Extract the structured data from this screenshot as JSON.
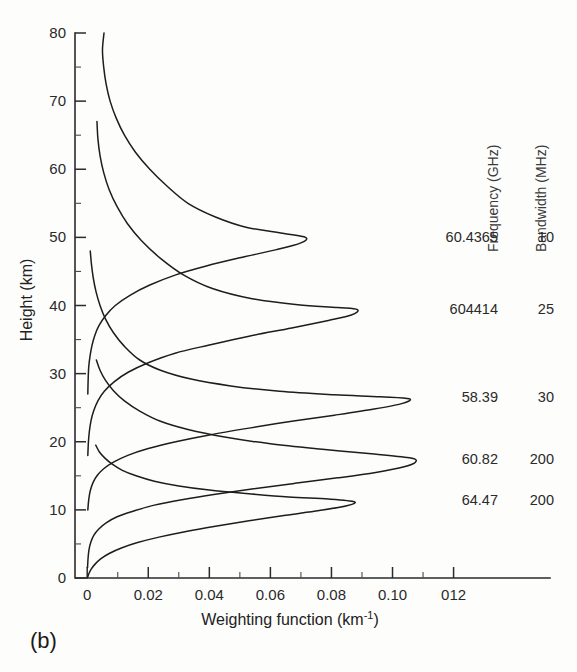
{
  "panel": {
    "label": "(b)"
  },
  "chart_data": {
    "type": "line",
    "title": "",
    "subtitle": "",
    "xlabel": "Weighting function (km",
    "xlabel_sup": "-1",
    "xlabel_close": ")",
    "xlabel_full": "Weighting function (km⁻¹)",
    "ylabel": "Height (km)",
    "xlim": [
      -0.004,
      0.128
    ],
    "ylim": [
      0,
      80
    ],
    "grid": false,
    "legend_position": "right",
    "x_ticks": [
      0,
      0.02,
      0.04,
      0.06,
      0.08,
      0.1,
      0.12
    ],
    "x_tick_labels": [
      "0",
      "0.02",
      "0.04",
      "0.06",
      "0.08",
      "0.10",
      "012"
    ],
    "x_minor_ticks": [
      0.01,
      0.03,
      0.05,
      0.07,
      0.09,
      0.11
    ],
    "y_ticks": [
      0,
      10,
      20,
      30,
      40,
      50,
      60,
      70,
      80
    ],
    "y_tick_labels": [
      "0",
      "10",
      "20",
      "30",
      "40",
      "50",
      "60",
      "70",
      "80"
    ],
    "y_minor_ticks": [
      5,
      15,
      25,
      35,
      45,
      55,
      65,
      75
    ],
    "legend_headers": [
      "Frequency (GHz)",
      "Bandwidth (MHz)"
    ],
    "series": [
      {
        "name": "60.4365",
        "frequency_ghz": "60.4365",
        "bandwidth_mhz": "10",
        "peak_x": 0.0715,
        "peak_y": 50,
        "label_y": 50,
        "points": [
          [
            0.0055,
            80
          ],
          [
            0.005,
            77.5
          ],
          [
            0.0054,
            75
          ],
          [
            0.0062,
            72.5
          ],
          [
            0.0075,
            70
          ],
          [
            0.0095,
            67.5
          ],
          [
            0.0122,
            65
          ],
          [
            0.0158,
            62.5
          ],
          [
            0.0205,
            60
          ],
          [
            0.0262,
            57.5
          ],
          [
            0.033,
            55
          ],
          [
            0.042,
            53
          ],
          [
            0.052,
            51.5
          ],
          [
            0.064,
            50.6
          ],
          [
            0.0715,
            50.0
          ],
          [
            0.07,
            49.2
          ],
          [
            0.062,
            48.2
          ],
          [
            0.05,
            47.0
          ],
          [
            0.039,
            45.8
          ],
          [
            0.029,
            44.5
          ],
          [
            0.0205,
            43.0
          ],
          [
            0.014,
            41.5
          ],
          [
            0.0092,
            40.0
          ],
          [
            0.006,
            38.5
          ],
          [
            0.0038,
            37.0
          ],
          [
            0.0024,
            35.5
          ],
          [
            0.0015,
            34.0
          ],
          [
            0.0009,
            32.5
          ],
          [
            0.0005,
            31.0
          ],
          [
            0.0003,
            29.0
          ],
          [
            0.0002,
            27.0
          ]
        ]
      },
      {
        "name": "60.4414",
        "frequency_ghz": "604414",
        "bandwidth_mhz": "25",
        "peak_x": 0.0885,
        "peak_y": 39.5,
        "label_y": 39.5,
        "points": [
          [
            0.0032,
            67
          ],
          [
            0.0035,
            64.5
          ],
          [
            0.0042,
            62
          ],
          [
            0.0054,
            59.5
          ],
          [
            0.0072,
            57
          ],
          [
            0.0098,
            54.5
          ],
          [
            0.0132,
            52
          ],
          [
            0.0178,
            49.5
          ],
          [
            0.0238,
            47
          ],
          [
            0.0315,
            44.5
          ],
          [
            0.041,
            42.5
          ],
          [
            0.054,
            41.0
          ],
          [
            0.069,
            40.1
          ],
          [
            0.082,
            39.7
          ],
          [
            0.0885,
            39.4
          ],
          [
            0.0865,
            38.6
          ],
          [
            0.079,
            37.8
          ],
          [
            0.067,
            36.7
          ],
          [
            0.053,
            35.5
          ],
          [
            0.04,
            34.2
          ],
          [
            0.0288,
            33.0
          ],
          [
            0.02,
            31.6
          ],
          [
            0.0134,
            30.2
          ],
          [
            0.0088,
            28.8
          ],
          [
            0.0056,
            27.4
          ],
          [
            0.0035,
            26.0
          ],
          [
            0.0021,
            24.5
          ],
          [
            0.0012,
            23.0
          ],
          [
            0.0007,
            21.5
          ],
          [
            0.0004,
            20.0
          ],
          [
            0.0002,
            18.0
          ]
        ]
      },
      {
        "name": "58.39",
        "frequency_ghz": "58.39",
        "bandwidth_mhz": "30",
        "peak_x": 0.1055,
        "peak_y": 26.5,
        "label_y": 26.5,
        "points": [
          [
            0.001,
            48
          ],
          [
            0.0014,
            46
          ],
          [
            0.002,
            44
          ],
          [
            0.0029,
            42
          ],
          [
            0.0042,
            40
          ],
          [
            0.006,
            38
          ],
          [
            0.0086,
            36
          ],
          [
            0.0122,
            34
          ],
          [
            0.0172,
            32
          ],
          [
            0.024,
            30.5
          ],
          [
            0.034,
            29.2
          ],
          [
            0.047,
            28.2
          ],
          [
            0.063,
            27.4
          ],
          [
            0.081,
            26.9
          ],
          [
            0.096,
            26.6
          ],
          [
            0.1055,
            26.3
          ],
          [
            0.103,
            25.6
          ],
          [
            0.094,
            24.8
          ],
          [
            0.081,
            23.9
          ],
          [
            0.067,
            23.0
          ],
          [
            0.053,
            22.0
          ],
          [
            0.04,
            21.0
          ],
          [
            0.029,
            20.0
          ],
          [
            0.02,
            19.0
          ],
          [
            0.0133,
            18.0
          ],
          [
            0.0086,
            17.0
          ],
          [
            0.0053,
            16.0
          ],
          [
            0.0032,
            15.0
          ],
          [
            0.0019,
            14.0
          ],
          [
            0.001,
            12.8
          ],
          [
            0.0005,
            11.5
          ],
          [
            0.0002,
            10.0
          ]
        ]
      },
      {
        "name": "60.82",
        "frequency_ghz": "60.82",
        "bandwidth_mhz": "200",
        "peak_x": 0.1075,
        "peak_y": 17.5,
        "label_y": 17.5,
        "points": [
          [
            0.003,
            32
          ],
          [
            0.0042,
            30.5
          ],
          [
            0.006,
            29
          ],
          [
            0.0086,
            27.5
          ],
          [
            0.0122,
            26
          ],
          [
            0.0172,
            24.5
          ],
          [
            0.024,
            23
          ],
          [
            0.033,
            21.8
          ],
          [
            0.045,
            20.7
          ],
          [
            0.06,
            19.7
          ],
          [
            0.077,
            18.9
          ],
          [
            0.094,
            18.2
          ],
          [
            0.106,
            17.6
          ],
          [
            0.1075,
            17.0
          ],
          [
            0.1035,
            16.3
          ],
          [
            0.0945,
            15.5
          ],
          [
            0.082,
            14.7
          ],
          [
            0.068,
            13.9
          ],
          [
            0.0545,
            13.1
          ],
          [
            0.042,
            12.3
          ],
          [
            0.031,
            11.5
          ],
          [
            0.022,
            10.7
          ],
          [
            0.015,
            9.8
          ],
          [
            0.0098,
            9.0
          ],
          [
            0.0062,
            8.1
          ],
          [
            0.0038,
            7.2
          ],
          [
            0.0022,
            6.3
          ],
          [
            0.0012,
            5.3
          ],
          [
            0.0006,
            4.2
          ],
          [
            0.0003,
            3.0
          ],
          [
            0.0001,
            1.5
          ]
        ]
      },
      {
        "name": "64.47",
        "frequency_ghz": "64.47",
        "bandwidth_mhz": "200",
        "peak_x": 0.0875,
        "peak_y": 11.5,
        "label_y": 11.5,
        "points": [
          [
            0.0028,
            19.5
          ],
          [
            0.004,
            18.5
          ],
          [
            0.0058,
            17.6
          ],
          [
            0.0082,
            16.7
          ],
          [
            0.0115,
            15.8
          ],
          [
            0.016,
            15.0
          ],
          [
            0.022,
            14.2
          ],
          [
            0.03,
            13.5
          ],
          [
            0.04,
            12.9
          ],
          [
            0.052,
            12.4
          ],
          [
            0.066,
            11.9
          ],
          [
            0.079,
            11.6
          ],
          [
            0.0875,
            11.2
          ],
          [
            0.085,
            10.6
          ],
          [
            0.076,
            9.9
          ],
          [
            0.065,
            9.2
          ],
          [
            0.053,
            8.4
          ],
          [
            0.042,
            7.6
          ],
          [
            0.032,
            6.8
          ],
          [
            0.0235,
            6.0
          ],
          [
            0.0165,
            5.2
          ],
          [
            0.0112,
            4.4
          ],
          [
            0.0072,
            3.6
          ],
          [
            0.0044,
            2.8
          ],
          [
            0.0025,
            2.0
          ],
          [
            0.0013,
            1.3
          ],
          [
            0.0006,
            0.7
          ],
          [
            0.0002,
            0.2
          ],
          [
            0.0,
            0.0
          ]
        ]
      }
    ]
  }
}
